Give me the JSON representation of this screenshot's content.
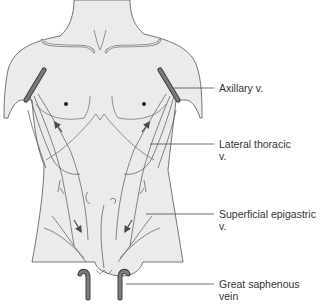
{
  "figure": {
    "colors": {
      "background": "#ffffff",
      "body_fill": "#ebebeb",
      "outline": "#555555",
      "vein_fill": "#6b6b6b",
      "vein_edge": "#3a3a3a",
      "leader_line": "#4a4a4a",
      "label_text": "#333333"
    }
  },
  "labels": [
    {
      "id": "axillary",
      "line1": "Axillary v.",
      "line2": ""
    },
    {
      "id": "lateral-thoracic",
      "line1": "Lateral thoracic",
      "line2": "v."
    },
    {
      "id": "superficial-epigastric",
      "line1": "Superficial epigastric",
      "line2": "v."
    },
    {
      "id": "great-saphenous",
      "line1": "Great saphenous",
      "line2": "vein"
    }
  ],
  "annotations": {
    "arrows": [
      "upward-left-chest",
      "upward-right-chest",
      "downward-left-abdomen",
      "downward-right-abdomen"
    ],
    "icons": [
      "nipple-dot-left",
      "nipple-dot-right"
    ]
  }
}
